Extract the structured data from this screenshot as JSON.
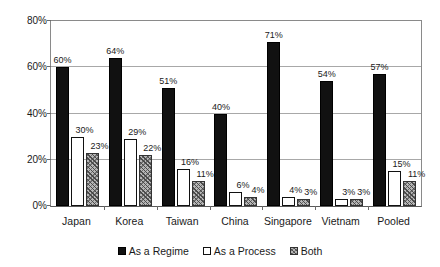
{
  "chart_data": {
    "type": "bar",
    "title": "",
    "subtitle": "",
    "xlabel": "",
    "ylabel": "",
    "ylim": [
      0,
      80
    ],
    "ytick_labels": [
      "0%",
      "20%",
      "40%",
      "60%",
      "80%"
    ],
    "ytick_values": [
      0,
      20,
      40,
      60,
      80
    ],
    "grid": true,
    "legend_position": "bottom",
    "value_label_suffix": "%",
    "categories": [
      "Japan",
      "Korea",
      "Taiwan",
      "China",
      "Singapore",
      "Vietnam",
      "Pooled"
    ],
    "series": [
      {
        "name": "As a Regime",
        "style": "solid-black",
        "color": "#111111",
        "values": [
          60,
          64,
          51,
          40,
          71,
          54,
          57
        ],
        "labels": [
          "60%",
          "64%",
          "51%",
          "40%",
          "71%",
          "54%",
          "57%"
        ]
      },
      {
        "name": "As a Process",
        "style": "white-outline",
        "color": "#ffffff",
        "values": [
          30,
          29,
          16,
          6,
          4,
          3,
          15
        ],
        "labels": [
          "30%",
          "29%",
          "16%",
          "6%",
          "4%",
          "3%",
          "15%"
        ]
      },
      {
        "name": "Both",
        "style": "diagonal-hatch-gray",
        "color": "#b6b6b6",
        "values": [
          23,
          22,
          11,
          4,
          3,
          3,
          11
        ],
        "labels": [
          "23%",
          "22%",
          "11%",
          "4%",
          "3%",
          "3%",
          "11%"
        ]
      }
    ]
  },
  "legend": {
    "items": [
      {
        "label": "As a Regime",
        "style": "regime"
      },
      {
        "label": "As a Process",
        "style": "process"
      },
      {
        "label": "Both",
        "style": "both"
      }
    ]
  }
}
